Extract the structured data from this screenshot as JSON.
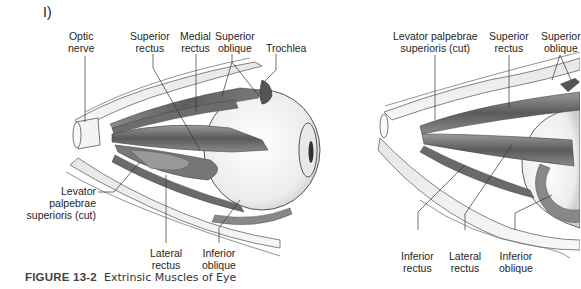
{
  "panel_label": "I)",
  "figure": {
    "number": "FIGURE 13-2",
    "title": "Extrinsic Muscles of Eye"
  },
  "left_view": {
    "labels": {
      "optic_nerve": [
        "Optic",
        "nerve"
      ],
      "superior_rectus": [
        "Superior",
        "rectus"
      ],
      "medial_rectus": [
        "Medial",
        "rectus"
      ],
      "superior_oblique": [
        "Superior",
        "oblique"
      ],
      "trochlea": [
        "Trochlea"
      ],
      "levator": [
        "Levator",
        "palpebrae",
        "superioris (cut)"
      ],
      "lateral_rectus": [
        "Lateral",
        "rectus"
      ],
      "inferior_oblique": [
        "Inferior",
        "oblique"
      ]
    }
  },
  "right_view": {
    "labels": {
      "levator": [
        "Levator palpebrae",
        "superioris (cut)"
      ],
      "superior_rectus": [
        "Superior",
        "rectus"
      ],
      "superior_oblique": [
        "Superior",
        "oblique"
      ],
      "inferior_rectus": [
        "Inferior",
        "rectus"
      ],
      "lateral_rectus": [
        "Lateral",
        "rectus"
      ],
      "inferior_oblique": [
        "Inferior",
        "oblique"
      ]
    }
  }
}
